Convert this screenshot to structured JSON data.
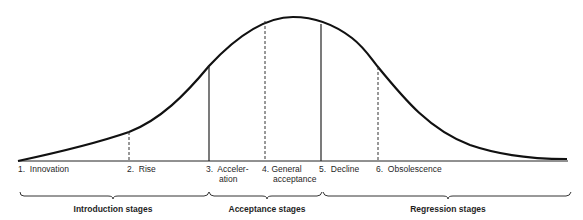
{
  "diagram": {
    "type": "product-life-cycle-bell-curve",
    "stages": [
      {
        "num": "1.",
        "label": "Innovation",
        "line1": "Innovation",
        "line2": "",
        "x": 18,
        "marker": "none"
      },
      {
        "num": "2.",
        "label": "Rise",
        "line1": "Rise",
        "line2": "",
        "x": 129,
        "marker": "dashed"
      },
      {
        "num": "3.",
        "label": "Acceleration",
        "line1": "Acceler-",
        "line2": "ation",
        "x": 209,
        "marker": "solid"
      },
      {
        "num": "4.",
        "label": "General acceptance",
        "line1": "General",
        "line2": "acceptance",
        "x": 265,
        "marker": "dashed"
      },
      {
        "num": "5.",
        "label": "Decline",
        "line1": "Decline",
        "line2": "",
        "x": 321,
        "marker": "solid"
      },
      {
        "num": "6.",
        "label": "Obsolescence",
        "line1": "Obsolescence",
        "line2": "",
        "x": 378,
        "marker": "dashed"
      }
    ],
    "groups": [
      {
        "label": "Introduction stages",
        "from_stage": 1,
        "to_stage": 2
      },
      {
        "label": "Acceptance stages",
        "from_stage": 3,
        "to_stage": 4
      },
      {
        "label": "Regression stages",
        "from_stage": 5,
        "to_stage": 6
      }
    ],
    "colors": {
      "curve": "#111111",
      "lines": "#222222",
      "background": "#ffffff"
    }
  }
}
